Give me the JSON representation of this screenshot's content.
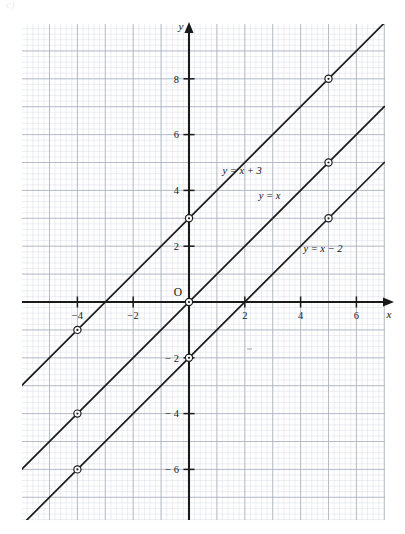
{
  "figure": {
    "corner_mark": "c)",
    "background_color": "#ffffff",
    "grid_minor_color": "#d9dde6",
    "grid_major_color": "#a9b0bd",
    "axis_color": "#1a1a1a",
    "line_color": "#1a1a1a",
    "marker_fill": "#ffffff",
    "marker_stroke": "#1a1a1a"
  },
  "chart_data": {
    "type": "line",
    "title": "",
    "xlabel": "x",
    "ylabel": "y",
    "xlim": [
      -6,
      7
    ],
    "ylim": [
      -7.2,
      9.2
    ],
    "grid": true,
    "grid_minor_step": 0.2,
    "grid_major_step": 1,
    "origin_label": "O",
    "xticks": [
      -4,
      -2,
      2,
      4,
      6
    ],
    "xtick_labels": [
      "−4",
      "−2",
      "2",
      "4",
      "6"
    ],
    "yticks": [
      -6,
      -4,
      -2,
      2,
      4,
      6,
      8
    ],
    "ytick_labels": [
      "− 6",
      "− 4",
      "− 2",
      "2",
      "4",
      "6",
      "8"
    ],
    "legend_position": "inline-labels",
    "series": [
      {
        "name": "y = x + 3",
        "label": "y = x + 3",
        "label_at": {
          "x": 1.2,
          "y": 4.6
        },
        "slope": 1,
        "intercept": 3,
        "x": [
          -6,
          7
        ],
        "values": [
          -3,
          10
        ],
        "points": [
          {
            "x": -4,
            "y": -1
          },
          {
            "x": 0,
            "y": 3
          },
          {
            "x": 5,
            "y": 8
          }
        ]
      },
      {
        "name": "y = x",
        "label": "y = x",
        "label_at": {
          "x": 2.5,
          "y": 3.7
        },
        "slope": 1,
        "intercept": 0,
        "x": [
          -6,
          7
        ],
        "values": [
          -6,
          7
        ],
        "points": [
          {
            "x": -4,
            "y": -4
          },
          {
            "x": 0,
            "y": 0
          },
          {
            "x": 5,
            "y": 5
          }
        ]
      },
      {
        "name": "y = x - 2",
        "label": "y = x − 2",
        "label_at": {
          "x": 4.1,
          "y": 1.8
        },
        "slope": 1,
        "intercept": -2,
        "x": [
          -6,
          7
        ],
        "values": [
          -8,
          5
        ],
        "points": [
          {
            "x": -4,
            "y": -6
          },
          {
            "x": 0,
            "y": -2
          },
          {
            "x": 5,
            "y": 3
          }
        ]
      }
    ]
  }
}
